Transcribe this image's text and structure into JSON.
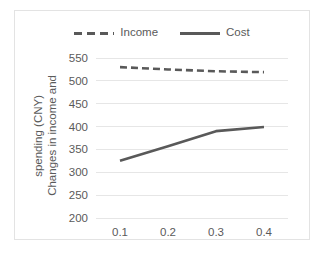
{
  "chart_data": {
    "type": "line",
    "title": "",
    "xlabel": "",
    "ylabel": "Changes in income and spending (CNY)",
    "ylabel_line1": "Changes in income and",
    "ylabel_line2": "spending (CNY)",
    "x": [
      0.1,
      0.2,
      0.3,
      0.4
    ],
    "categories": [
      "0.1",
      "0.2",
      "0.3",
      "0.4"
    ],
    "xticklabels": [
      "0.1",
      "0.2",
      "0.3",
      "0.4"
    ],
    "yticklabels": [
      "200",
      "250",
      "300",
      "350",
      "400",
      "450",
      "500",
      "550"
    ],
    "yticks": [
      200,
      250,
      300,
      350,
      400,
      450,
      500,
      550
    ],
    "ylim": [
      200,
      550
    ],
    "xlim": [
      0.05,
      0.45
    ],
    "grid": "horizontal",
    "legend_position": "top-center",
    "series": [
      {
        "name": "Income",
        "values": [
          530,
          525,
          521,
          519
        ],
        "style": "dashed",
        "color": "#595959"
      },
      {
        "name": "Cost",
        "values": [
          325,
          357,
          390,
          399
        ],
        "style": "solid",
        "color": "#595959"
      }
    ]
  },
  "legend": {
    "items": [
      {
        "label": "Income",
        "marker": "dashed-line-swatch"
      },
      {
        "label": "Cost",
        "marker": "solid-line-swatch"
      }
    ]
  },
  "colors": {
    "line": "#595959",
    "gridline": "#e6e6e6",
    "text": "#5a5a5a",
    "frame": "#e3e3e3",
    "background": "#ffffff"
  }
}
